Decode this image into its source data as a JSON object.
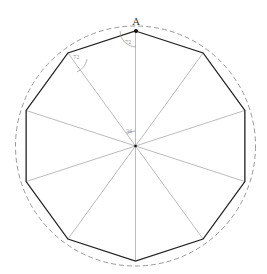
{
  "diagram": {
    "vertex_label": "A",
    "angle_labels": {
      "interior_a": "72",
      "interior_b": "72",
      "central": "36"
    },
    "center": [
      135.5,
      146
    ],
    "polygon_radius": 115,
    "circle_radius": 120,
    "sides": 10,
    "colors": {
      "polygon": "#222222",
      "spokes": "#aaaaaa",
      "circle": "#999999"
    }
  }
}
